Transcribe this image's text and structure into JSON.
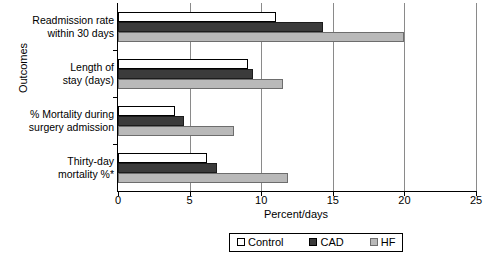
{
  "chart_data": {
    "type": "bar",
    "orientation": "horizontal",
    "title": "",
    "xlabel": "Percent/days",
    "ylabel": "Outcomes",
    "xlim": [
      0,
      25
    ],
    "xticks": [
      0,
      5,
      10,
      15,
      20,
      25
    ],
    "xtick_labels": [
      "0",
      "5",
      "10",
      "15",
      "20",
      "25"
    ],
    "grid": true,
    "grid_axis": "x",
    "legend_position": "bottom",
    "categories": [
      "Readmission rate within 30 days",
      "Length of stay (days)",
      "% Mortality during surgery admission",
      "Thirty-day mortality %*"
    ],
    "category_lines": [
      [
        "Readmission rate",
        "within 30 days"
      ],
      [
        "Length of",
        "stay (days)"
      ],
      [
        "% Mortality during",
        "surgery admission"
      ],
      [
        "Thirty-day",
        "mortality %*"
      ]
    ],
    "series": [
      {
        "name": "Control",
        "color": "#ffffff",
        "values": [
          11.0,
          9.1,
          4.0,
          6.2
        ]
      },
      {
        "name": "CAD",
        "color": "#3b3b3b",
        "values": [
          14.3,
          9.4,
          4.6,
          6.9
        ]
      },
      {
        "name": "HF",
        "color": "#b9b9b9",
        "values": [
          20.0,
          11.5,
          8.1,
          11.9
        ]
      }
    ]
  },
  "axes": {
    "y_title": "Outcomes",
    "x_title": "Percent/days"
  },
  "legend": {
    "items": [
      {
        "label": "Control",
        "swatch": "control"
      },
      {
        "label": "CAD",
        "swatch": "cad"
      },
      {
        "label": "HF",
        "swatch": "hf"
      }
    ]
  }
}
